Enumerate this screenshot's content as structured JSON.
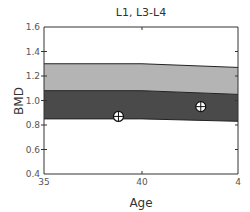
{
  "chart_data": {
    "type": "area",
    "title": "L1, L3-L4",
    "xlabel": "Age",
    "ylabel": "BMD",
    "xlim": [
      35,
      44.9
    ],
    "ylim": [
      0.4,
      1.6
    ],
    "x_ticks": [
      35,
      40,
      45
    ],
    "x_tick_labels": [
      "35",
      "40",
      "4"
    ],
    "y_ticks": [
      0.4,
      0.6,
      0.8,
      1.0,
      1.2,
      1.4,
      1.6
    ],
    "y_tick_labels": [
      "0.4",
      "0.6",
      "0.8",
      "1.0",
      "1.2",
      "1.4",
      "1.6"
    ],
    "grid": false,
    "bands": [
      {
        "name": "upper-reference-band",
        "color": "#b4b4b4",
        "x": [
          35,
          40,
          44.9
        ],
        "upper": [
          1.3,
          1.3,
          1.27
        ],
        "lower": [
          1.08,
          1.08,
          1.05
        ]
      },
      {
        "name": "lower-reference-band",
        "color": "#4a4a4a",
        "x": [
          35,
          40,
          44.9
        ],
        "upper": [
          1.08,
          1.08,
          1.05
        ],
        "lower": [
          0.85,
          0.85,
          0.83
        ]
      }
    ],
    "points": [
      {
        "x": 38.8,
        "y": 0.87
      },
      {
        "x": 43.0,
        "y": 0.95
      }
    ]
  }
}
